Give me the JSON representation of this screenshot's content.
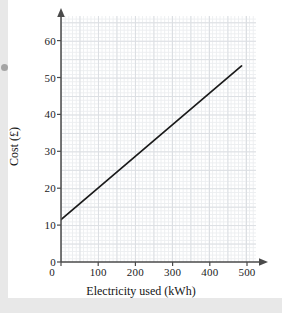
{
  "figure": {
    "background_color": "#ffffff",
    "page_margin_color": "#e8e8e8",
    "line_color": "#1a1a1a",
    "axis_color": "#4a4a4a",
    "grid_major_color": "#dcdfe3",
    "grid_minor_color": "#eceef0"
  },
  "axes": {
    "y_title": "Cost (£)",
    "x_title": "Electricity used (kWh)",
    "x_ticks": [
      "0",
      "100",
      "200",
      "300",
      "400",
      "500"
    ],
    "y_ticks": [
      "0",
      "10",
      "20",
      "30",
      "40",
      "50",
      "60"
    ],
    "x_origin_label": "0",
    "y_origin_label": "0"
  },
  "chart_data": {
    "type": "line",
    "title": "",
    "subtitle": "",
    "xlabel": "Electricity used (kWh)",
    "ylabel": "Cost (£)",
    "xlim": [
      0,
      540
    ],
    "ylim": [
      0,
      64
    ],
    "xticks": [
      0,
      100,
      200,
      300,
      400,
      500
    ],
    "yticks": [
      0,
      10,
      20,
      30,
      40,
      50,
      60
    ],
    "xtick_labels": [
      "0",
      "100",
      "200",
      "300",
      "400",
      "500"
    ],
    "ytick_labels": [
      "0",
      "10",
      "20",
      "30",
      "40",
      "50",
      "60"
    ],
    "grid": true,
    "grid_minor": true,
    "legend": null,
    "legend_position": "none",
    "annotations": [],
    "series": [
      {
        "name": "Electricity cost",
        "type": "line",
        "color": "#1a1a1a",
        "linewidth": 1.6,
        "marker": "none",
        "x": [
          0,
          100,
          200,
          300,
          400,
          500
        ],
        "y": [
          11,
          19,
          27,
          35,
          43,
          51
        ],
        "intercept": 11,
        "gradient": 0.08,
        "endpoints": [
          [
            0,
            11
          ],
          [
            500,
            51
          ]
        ]
      }
    ]
  }
}
